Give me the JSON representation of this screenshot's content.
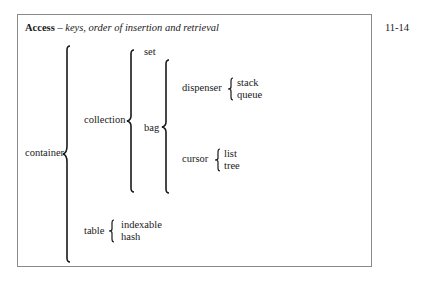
{
  "slide": {
    "title_bold": "Access",
    "title_dash": " – ",
    "title_italic": "keys, order of insertion and retrieval",
    "page_number": "11-14"
  },
  "tree": {
    "root": "container",
    "container_children": [
      "collection",
      "table"
    ],
    "collection_children": [
      "set",
      "bag"
    ],
    "bag_children": [
      "dispenser",
      "cursor"
    ],
    "dispenser_children": [
      "stack",
      "queue"
    ],
    "cursor_children": [
      "list",
      "tree"
    ],
    "table_children": [
      "indexable",
      "hash"
    ]
  },
  "colors": {
    "frame": "#8a8a8a",
    "text": "#1a1a1a"
  }
}
